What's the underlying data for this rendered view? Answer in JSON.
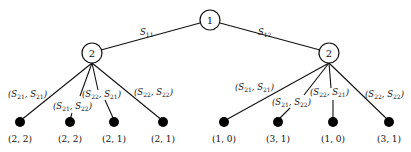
{
  "root": {
    "label": "1",
    "x": 210,
    "y": 20
  },
  "player2_nodes": [
    {
      "label": "2",
      "x": 92,
      "y": 53
    },
    {
      "label": "2",
      "x": 329,
      "y": 53
    }
  ],
  "root_edges": [
    {
      "S": "S",
      "sub": "11",
      "lx": 140,
      "ly": 35
    },
    {
      "S": "S",
      "sub": "12",
      "lx": 260,
      "ly": 35
    }
  ],
  "leaf_edges_left": [
    {
      "a": "21",
      "b": "21",
      "lx": 8,
      "ly": 97,
      "payoff": "(2, 2)",
      "x": 20
    },
    {
      "a": "21",
      "b": "22",
      "lx": 54,
      "ly": 108,
      "payoff": "(2, 2)",
      "x": 70
    },
    {
      "a": "22",
      "b": "21",
      "lx": 82,
      "ly": 97,
      "payoff": "(2, 1)",
      "x": 114
    },
    {
      "a": "22",
      "b": "22",
      "lx": 135,
      "ly": 94,
      "payoff": "(2, 1)",
      "x": 163
    }
  ],
  "leaf_edges_right": [
    {
      "a": "21",
      "b": "21",
      "lx": 236,
      "ly": 90,
      "payoff": "(1, 0)",
      "x": 224
    },
    {
      "a": "21",
      "b": "22",
      "lx": 272,
      "ly": 104,
      "payoff": "(3, 1)",
      "x": 278
    },
    {
      "a": "22",
      "b": "21",
      "lx": 310,
      "ly": 95,
      "payoff": "(1, 0)",
      "x": 333
    },
    {
      "a": "22",
      "b": "22",
      "lx": 365,
      "ly": 97,
      "payoff": "(3, 1)",
      "x": 389
    }
  ]
}
